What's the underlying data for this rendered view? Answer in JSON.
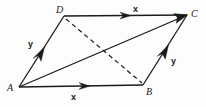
{
  "figure": {
    "kind": "geometry-vector-diagram",
    "width": 206,
    "height": 107,
    "background_color": "#fdfdfd",
    "stroke_color": "#1b1b1b",
    "vertices": [
      {
        "id": "A",
        "label": "A",
        "x": 19,
        "y": 87,
        "label_x": 7,
        "label_y": 83
      },
      {
        "id": "B",
        "label": "B",
        "x": 143,
        "y": 85,
        "label_x": 146,
        "label_y": 87
      },
      {
        "id": "C",
        "label": "C",
        "x": 187,
        "y": 15,
        "label_x": 191,
        "label_y": 9
      },
      {
        "id": "D",
        "label": "D",
        "x": 64,
        "y": 16,
        "label_x": 56,
        "label_y": 5
      }
    ],
    "edges": [
      {
        "id": "AB",
        "from": "A",
        "to": "B",
        "style": "solid",
        "arrow": "mid"
      },
      {
        "id": "DC",
        "from": "D",
        "to": "C",
        "style": "solid",
        "arrow": "mid"
      },
      {
        "id": "AD",
        "from": "A",
        "to": "D",
        "style": "solid",
        "arrow": "mid"
      },
      {
        "id": "BC",
        "from": "B",
        "to": "C",
        "style": "solid",
        "arrow": "mid"
      },
      {
        "id": "AC",
        "from": "A",
        "to": "C",
        "style": "solid",
        "arrow": "end"
      },
      {
        "id": "DB",
        "from": "D",
        "to": "B",
        "style": "dashed",
        "arrow": "none"
      }
    ],
    "vector_labels": [
      {
        "id": "x-top",
        "text": "x",
        "edge": "DC",
        "x": 133,
        "y": 5
      },
      {
        "id": "x-bottom",
        "text": "x",
        "edge": "AB",
        "x": 71,
        "y": 93
      },
      {
        "id": "y-left",
        "text": "y",
        "edge": "AD",
        "x": 28,
        "y": 40
      },
      {
        "id": "y-right",
        "text": "y",
        "edge": "BC",
        "x": 171,
        "y": 57
      }
    ]
  }
}
